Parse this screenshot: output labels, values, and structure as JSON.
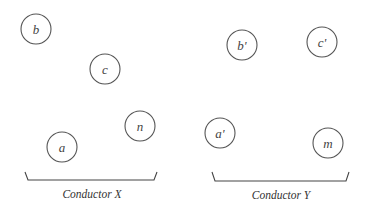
{
  "diagram": {
    "conductors": [
      {
        "name": "Conductor X",
        "bracket": {
          "x1": 25,
          "x2": 157,
          "top": 172,
          "bottom": 180
        },
        "label_pos": {
          "x": 92,
          "y": 198
        },
        "wires": [
          {
            "label": "b",
            "cx": 36,
            "cy": 29,
            "r": 15
          },
          {
            "label": "c",
            "cx": 105,
            "cy": 69,
            "r": 15
          },
          {
            "label": "n",
            "cx": 140,
            "cy": 126,
            "r": 15
          },
          {
            "label": "a",
            "cx": 62,
            "cy": 147,
            "r": 15
          }
        ]
      },
      {
        "name": "Conductor Y",
        "bracket": {
          "x1": 212,
          "x2": 349,
          "top": 172,
          "bottom": 181
        },
        "label_pos": {
          "x": 281,
          "y": 199
        },
        "wires": [
          {
            "label": "b'",
            "cx": 242,
            "cy": 45,
            "r": 15
          },
          {
            "label": "c'",
            "cx": 322,
            "cy": 42,
            "r": 15
          },
          {
            "label": "a'",
            "cx": 220,
            "cy": 133,
            "r": 15
          },
          {
            "label": "m",
            "cx": 328,
            "cy": 143,
            "r": 15
          }
        ]
      }
    ],
    "colors": {
      "stroke": "#555555",
      "text": "#444444",
      "background": "#ffffff"
    }
  }
}
